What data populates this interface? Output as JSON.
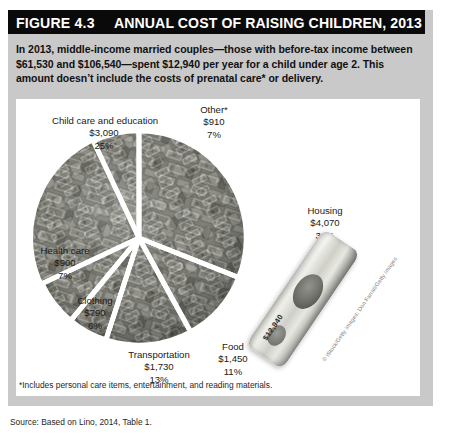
{
  "figure": {
    "number_label": "FIGURE 4.3",
    "title": "ANNUAL COST OF RAISING CHILDREN, 2013",
    "intro": "In 2013, middle-income married couples—those with before-tax income between $61,530 and $106,540—spent $12,940 per year for a child under age 2. This amount doesn’t include the costs of prenatal care* or delivery.",
    "footnote": "*Includes personal care items, entertainment, and reading materials.",
    "source": "Source: Based on Lino, 2014, Table 1.",
    "photo_credit": "© iStock/Getty Images; Don Farrall/Getty Images",
    "bill_amount": "$12,940"
  },
  "colors": {
    "title_bar": "#0a0a0a",
    "title_text": "#ffffff",
    "frame": "#c9c9c9",
    "panel": "#ffffff",
    "body_text": "#111111",
    "slice_gap": "#ffffff"
  },
  "chart_data": {
    "type": "pie",
    "title": "Annual Cost of Raising Children, 2013",
    "total": "$12,940",
    "value_prefix": "$",
    "legend": "labels-outside",
    "grid": false,
    "categories": [
      "Housing",
      "Food",
      "Transportation",
      "Clothing",
      "Health care",
      "Child care and education",
      "Other*"
    ],
    "values": [
      4070,
      1450,
      1730,
      790,
      900,
      3090,
      910
    ],
    "percents": [
      31,
      11,
      13,
      6,
      7,
      25,
      7
    ],
    "slices": [
      {
        "label": "Housing",
        "amount": "$4,070",
        "percent": "31%",
        "value": 4070,
        "pct": 31
      },
      {
        "label": "Food",
        "amount": "$1,450",
        "percent": "11%",
        "value": 1450,
        "pct": 11
      },
      {
        "label": "Transportation",
        "amount": "$1,730",
        "percent": "13%",
        "value": 1730,
        "pct": 13
      },
      {
        "label": "Clothing",
        "amount": "$790",
        "percent": "6%",
        "value": 790,
        "pct": 6
      },
      {
        "label": "Health care",
        "amount": "$900",
        "percent": "7%",
        "value": 900,
        "pct": 7
      },
      {
        "label": "Child care and education",
        "amount": "$3,090",
        "percent": "25%",
        "value": 3090,
        "pct": 25
      },
      {
        "label": "Other*",
        "amount": "$910",
        "percent": "7%",
        "value": 910,
        "pct": 7
      }
    ]
  }
}
